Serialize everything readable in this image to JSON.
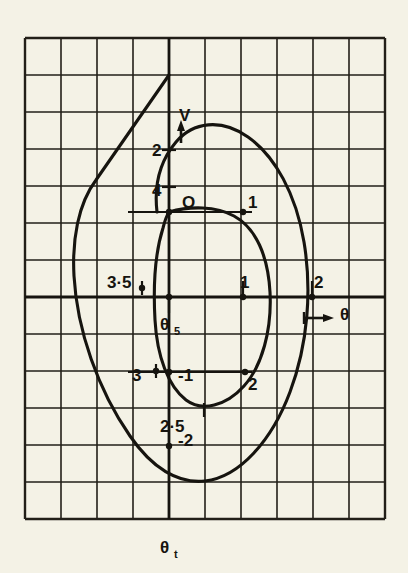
{
  "figure": {
    "kind": "phase-plane-diagram",
    "background_color": "#f4f2e6",
    "ink_color": "#16140f",
    "bottom_caption": "θ",
    "bottom_caption_sub": "t"
  },
  "chart_data": {
    "type": "line",
    "title": "",
    "xlabel": "θ",
    "ylabel": "V",
    "grid": true,
    "legend": false,
    "axis_labels": {
      "vertical_axis_name": "V",
      "vertical_axis_arrow": "up",
      "horizontal_axis_name": "θ",
      "horizontal_axis_arrow": "right",
      "vertical_axis_grid_label": "θ",
      "vertical_axis_grid_label_sub": "t",
      "origin_label": "O",
      "center_label": "θ",
      "center_label_sub": "5"
    },
    "grid_geometry": {
      "cols": 10,
      "rows": 13,
      "cell_w": 36,
      "cell_h": 37,
      "left": 25,
      "top": 38,
      "v_axis_x": 169,
      "h_axis_y": 297
    },
    "point_labels": [
      {
        "text": "V",
        "x": 179,
        "y": 121,
        "role": "vertical-axis-name"
      },
      {
        "text": "2",
        "x": 152,
        "y": 156,
        "role": "tick-label"
      },
      {
        "text": "4",
        "x": 152,
        "y": 196,
        "role": "tick-label"
      },
      {
        "text": "O",
        "x": 182,
        "y": 208,
        "role": "origin"
      },
      {
        "text": "1",
        "x": 248,
        "y": 208,
        "role": "point-label"
      },
      {
        "text": "3·5",
        "x": 107,
        "y": 288,
        "role": "point-label"
      },
      {
        "text": "1",
        "x": 240,
        "y": 288,
        "role": "tick-label"
      },
      {
        "text": "2",
        "x": 314,
        "y": 288,
        "role": "tick-label"
      },
      {
        "text": "θ",
        "x": 340,
        "y": 320,
        "role": "horizontal-axis-name"
      },
      {
        "text": "3",
        "x": 132,
        "y": 381,
        "role": "point-label"
      },
      {
        "text": "-1",
        "x": 178,
        "y": 381,
        "role": "tick-label"
      },
      {
        "text": "2",
        "x": 248,
        "y": 390,
        "role": "point-label"
      },
      {
        "text": "2·5",
        "x": 160,
        "y": 432,
        "role": "point-label"
      },
      {
        "text": "-2",
        "x": 178,
        "y": 446,
        "role": "tick-label"
      }
    ],
    "series": [
      {
        "name": "outer-trajectory",
        "description": "large closed phase trajectory with straight entry segment from upper left",
        "closed": true,
        "path": "M 169,75 L 96,180 C 78,204 72,240 74,276 C 77,330 98,390 130,436 C 152,468 178,484 205,481 C 240,477 272,440 290,392 C 308,344 312,290 304,242 C 296,194 275,156 248,137 C 221,118 193,122 176,142 C 160,161 154,186 157,212"
      },
      {
        "name": "inner-trajectory",
        "description": "small closed phase trajectory",
        "closed": true,
        "path": "M 169,212 C 190,206 216,206 234,216 C 256,228 268,256 270,292 C 272,330 262,366 244,386 C 226,406 202,412 186,400 C 168,386 157,356 155,320 C 153,284 156,250 163,228 C 165,220 167,215 169,212 Z"
      }
    ],
    "markers": [
      {
        "name": "origin-dot",
        "x": 169,
        "y": 212
      },
      {
        "name": "point-1-dot",
        "x": 243,
        "y": 212
      },
      {
        "name": "center-dot",
        "x": 169,
        "y": 297
      },
      {
        "name": "point-1h-dot",
        "x": 243,
        "y": 297
      },
      {
        "name": "point-minus1-dot",
        "x": 169,
        "y": 372
      },
      {
        "name": "point-minus2-dot",
        "x": 169,
        "y": 446
      },
      {
        "name": "point-3-dot",
        "x": 156,
        "y": 371
      },
      {
        "name": "point-2-dot",
        "x": 245,
        "y": 372
      },
      {
        "name": "point-35-dot",
        "x": 142,
        "y": 288
      },
      {
        "name": "point-2h-dot",
        "x": 312,
        "y": 297
      }
    ],
    "ticks": [
      {
        "name": "tick-V-2",
        "x": 169,
        "y": 150,
        "dir": "h"
      },
      {
        "name": "tick-V-4",
        "x": 169,
        "y": 187,
        "dir": "h"
      },
      {
        "name": "tick-35",
        "x": 142,
        "y": 288,
        "dir": "v"
      },
      {
        "name": "tick-1-upper",
        "x": 243,
        "y": 288,
        "dir": "v"
      },
      {
        "name": "tick-2-upper",
        "x": 312,
        "y": 288,
        "dir": "v"
      },
      {
        "name": "tick-theta5",
        "x": 169,
        "y": 306,
        "dir": "v"
      },
      {
        "name": "tick-25",
        "x": 204,
        "y": 410,
        "dir": "v"
      },
      {
        "name": "tick-3",
        "x": 156,
        "y": 371,
        "dir": "v"
      }
    ]
  }
}
